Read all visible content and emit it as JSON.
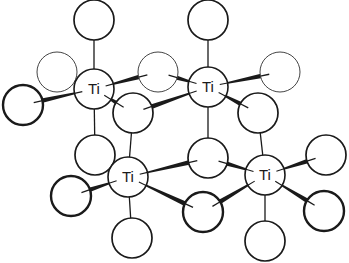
{
  "diagram": {
    "type": "crystal-structure",
    "element_label": "Ti",
    "colors": {
      "stroke": "#1a1a1a",
      "background": "#ffffff",
      "thin_stroke": "#444444"
    },
    "ti_atoms": [
      {
        "id": "ti1",
        "label": "Ti",
        "x": 94,
        "y": 89,
        "r": 20
      },
      {
        "id": "ti2",
        "label": "Ti",
        "x": 208,
        "y": 87,
        "r": 20
      },
      {
        "id": "ti3",
        "label": "Ti",
        "x": 128,
        "y": 177,
        "r": 20
      },
      {
        "id": "ti4",
        "label": "Ti",
        "x": 265,
        "y": 175,
        "r": 20
      }
    ],
    "o_atoms": [
      {
        "id": "o1",
        "x": 94,
        "y": 20,
        "r": 20,
        "weight": "normal"
      },
      {
        "id": "o2",
        "x": 208,
        "y": 20,
        "r": 20,
        "weight": "normal"
      },
      {
        "id": "o3",
        "x": 57,
        "y": 72,
        "r": 20,
        "weight": "thin"
      },
      {
        "id": "o4",
        "x": 23,
        "y": 105,
        "r": 20,
        "weight": "bold"
      },
      {
        "id": "o5",
        "x": 158,
        "y": 72,
        "r": 20,
        "weight": "thin"
      },
      {
        "id": "o6",
        "x": 133,
        "y": 113,
        "r": 20,
        "weight": "normal"
      },
      {
        "id": "o7",
        "x": 280,
        "y": 72,
        "r": 20,
        "weight": "thin"
      },
      {
        "id": "o8",
        "x": 258,
        "y": 113,
        "r": 20,
        "weight": "normal"
      },
      {
        "id": "o9",
        "x": 95,
        "y": 155,
        "r": 20,
        "weight": "normal"
      },
      {
        "id": "o10",
        "x": 208,
        "y": 158,
        "r": 20,
        "weight": "normal"
      },
      {
        "id": "o11",
        "x": 71,
        "y": 196,
        "r": 20,
        "weight": "bold"
      },
      {
        "id": "o12",
        "x": 132,
        "y": 238,
        "r": 20,
        "weight": "normal"
      },
      {
        "id": "o13",
        "x": 203,
        "y": 212,
        "r": 20,
        "weight": "bold"
      },
      {
        "id": "o14",
        "x": 326,
        "y": 155,
        "r": 20,
        "weight": "normal"
      },
      {
        "id": "o15",
        "x": 324,
        "y": 211,
        "r": 20,
        "weight": "bold"
      },
      {
        "id": "o16",
        "x": 265,
        "y": 241,
        "r": 20,
        "weight": "normal"
      }
    ],
    "bonds": [
      {
        "from": "ti1",
        "to": "o1",
        "style": "thin"
      },
      {
        "from": "ti1",
        "to": "o9",
        "style": "thin"
      },
      {
        "from": "ti1",
        "to": "o3",
        "style": "thin"
      },
      {
        "from": "ti1",
        "to": "o4",
        "style": "wedge"
      },
      {
        "from": "ti1",
        "to": "o5",
        "style": "wedge"
      },
      {
        "from": "ti1",
        "to": "o6",
        "style": "wedge"
      },
      {
        "from": "ti2",
        "to": "o2",
        "style": "thin"
      },
      {
        "from": "ti2",
        "to": "o10",
        "style": "thin"
      },
      {
        "from": "ti2",
        "to": "o5",
        "style": "wedge"
      },
      {
        "from": "ti2",
        "to": "o7",
        "style": "wedge"
      },
      {
        "from": "ti2",
        "to": "o6",
        "style": "wedge"
      },
      {
        "from": "ti2",
        "to": "o8",
        "style": "wedge"
      },
      {
        "from": "ti3",
        "to": "o6",
        "style": "thin"
      },
      {
        "from": "ti3",
        "to": "o12",
        "style": "thin"
      },
      {
        "from": "ti3",
        "to": "o9",
        "style": "thin"
      },
      {
        "from": "ti3",
        "to": "o11",
        "style": "wedge"
      },
      {
        "from": "ti3",
        "to": "o10",
        "style": "wedge"
      },
      {
        "from": "ti3",
        "to": "o13",
        "style": "wedge"
      },
      {
        "from": "ti4",
        "to": "o8",
        "style": "thin"
      },
      {
        "from": "ti4",
        "to": "o16",
        "style": "thin"
      },
      {
        "from": "ti4",
        "to": "o10",
        "style": "wedge"
      },
      {
        "from": "ti4",
        "to": "o13",
        "style": "wedge"
      },
      {
        "from": "ti4",
        "to": "o14",
        "style": "wedge"
      },
      {
        "from": "ti4",
        "to": "o15",
        "style": "wedge"
      }
    ]
  }
}
